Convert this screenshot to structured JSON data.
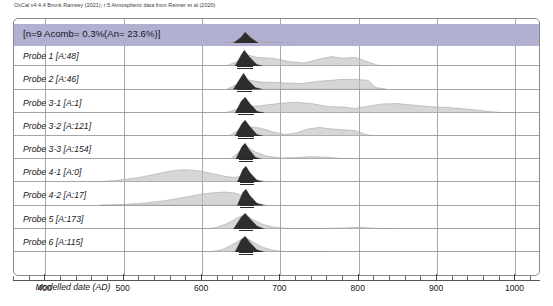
{
  "credit": "OxCal v4.4.4 Bronk Ramsey (2021); r:5 Atmospheric data from Reimer et al (2020)",
  "combined": {
    "label": "[n=9 Acomb= 0.3%(An= 23.6%)]",
    "color": "#b2b0d0"
  },
  "axis": {
    "title": "Modelled date (AD)",
    "ticks": [
      400,
      500,
      600,
      700,
      800,
      900,
      1000
    ],
    "minor_step": 20,
    "range": [
      360,
      1030
    ]
  },
  "chart_data": {
    "type": "area",
    "xlabel": "Modelled date (AD)",
    "ylabel": "",
    "xlim": [
      360,
      1030
    ],
    "grid": true,
    "legend": "none",
    "prior_color": "#bdbdbd",
    "posterior_color": "#2e2e2e",
    "series": [
      {
        "name": "[n=9 Acomb= 0.3%(An= 23.6%)]",
        "agreement": null,
        "posterior_peak": 655,
        "posterior_range": [
          645,
          668
        ],
        "prior": [
          [
            630,
            0
          ],
          [
            645,
            0.18
          ],
          [
            655,
            1.0
          ],
          [
            668,
            0.22
          ],
          [
            690,
            0.05
          ],
          [
            710,
            0
          ]
        ],
        "posterior": [
          [
            640,
            0
          ],
          [
            650,
            0.55
          ],
          [
            655,
            1.0
          ],
          [
            662,
            0.5
          ],
          [
            672,
            0
          ]
        ]
      },
      {
        "name": "Probe 1 [A:48]",
        "agreement": 48,
        "posterior_peak": 653,
        "posterior_range": [
          645,
          665
        ],
        "prior": [
          [
            630,
            0
          ],
          [
            645,
            0.3
          ],
          [
            655,
            0.75
          ],
          [
            670,
            0.55
          ],
          [
            690,
            0.5
          ],
          [
            710,
            0.3
          ],
          [
            730,
            0.2
          ],
          [
            750,
            0.45
          ],
          [
            765,
            0.6
          ],
          [
            780,
            0.5
          ],
          [
            795,
            0.55
          ],
          [
            810,
            0.3
          ],
          [
            825,
            0.05
          ],
          [
            840,
            0
          ]
        ],
        "posterior": [
          [
            642,
            0
          ],
          [
            650,
            0.7
          ],
          [
            654,
            1.0
          ],
          [
            660,
            0.6
          ],
          [
            670,
            0.1
          ],
          [
            678,
            0
          ]
        ]
      },
      {
        "name": "Probe 2 [A:46]",
        "agreement": 46,
        "posterior_peak": 653,
        "posterior_range": [
          644,
          664
        ],
        "prior": [
          [
            632,
            0
          ],
          [
            646,
            0.35
          ],
          [
            656,
            0.6
          ],
          [
            675,
            0.45
          ],
          [
            700,
            0.4
          ],
          [
            725,
            0.35
          ],
          [
            750,
            0.5
          ],
          [
            775,
            0.6
          ],
          [
            795,
            0.62
          ],
          [
            812,
            0.55
          ],
          [
            822,
            0.1
          ],
          [
            835,
            0
          ]
        ],
        "posterior": [
          [
            640,
            0
          ],
          [
            649,
            0.7
          ],
          [
            653,
            1.0
          ],
          [
            659,
            0.55
          ],
          [
            668,
            0.1
          ],
          [
            676,
            0
          ]
        ]
      },
      {
        "name": "Probe 3-1 [A:1]",
        "agreement": 1,
        "posterior_peak": 655,
        "posterior_range": [
          646,
          666
        ],
        "prior": [
          [
            628,
            0
          ],
          [
            645,
            0.25
          ],
          [
            660,
            0.4
          ],
          [
            680,
            0.5
          ],
          [
            700,
            0.62
          ],
          [
            720,
            0.68
          ],
          [
            740,
            0.6
          ],
          [
            760,
            0.42
          ],
          [
            780,
            0.38
          ],
          [
            795,
            0.3
          ],
          [
            810,
            0.42
          ],
          [
            830,
            0.58
          ],
          [
            850,
            0.6
          ],
          [
            870,
            0.5
          ],
          [
            890,
            0.42
          ],
          [
            915,
            0.35
          ],
          [
            940,
            0.25
          ],
          [
            965,
            0.12
          ],
          [
            990,
            0
          ]
        ],
        "posterior": [
          [
            642,
            0
          ],
          [
            650,
            0.75
          ],
          [
            655,
            1.0
          ],
          [
            661,
            0.6
          ],
          [
            670,
            0.12
          ],
          [
            680,
            0
          ]
        ]
      },
      {
        "name": "Probe 3-2 [A:121]",
        "agreement": 121,
        "posterior_peak": 655,
        "posterior_range": [
          646,
          666
        ],
        "prior": [
          [
            634,
            0
          ],
          [
            648,
            0.45
          ],
          [
            658,
            0.62
          ],
          [
            675,
            0.5
          ],
          [
            692,
            0.25
          ],
          [
            706,
            0.1
          ],
          [
            720,
            0.2
          ],
          [
            735,
            0.45
          ],
          [
            750,
            0.55
          ],
          [
            765,
            0.45
          ],
          [
            780,
            0.4
          ],
          [
            795,
            0.35
          ],
          [
            808,
            0.12
          ],
          [
            820,
            0
          ]
        ],
        "posterior": [
          [
            642,
            0
          ],
          [
            651,
            0.8
          ],
          [
            655,
            1.0
          ],
          [
            661,
            0.6
          ],
          [
            670,
            0.1
          ],
          [
            678,
            0
          ]
        ]
      },
      {
        "name": "Probe 3-3 [A:154]",
        "agreement": 154,
        "posterior_peak": 655,
        "posterior_range": [
          647,
          665
        ],
        "prior": [
          [
            636,
            0
          ],
          [
            648,
            0.5
          ],
          [
            657,
            0.8
          ],
          [
            668,
            0.45
          ],
          [
            682,
            0.2
          ],
          [
            700,
            0.08
          ],
          [
            720,
            0.1
          ],
          [
            740,
            0.16
          ],
          [
            760,
            0.12
          ],
          [
            778,
            0.05
          ],
          [
            795,
            0
          ]
        ],
        "posterior": [
          [
            643,
            0
          ],
          [
            651,
            0.8
          ],
          [
            655,
            1.0
          ],
          [
            660,
            0.6
          ],
          [
            668,
            0.12
          ],
          [
            676,
            0
          ]
        ]
      },
      {
        "name": "Probe 4-1 [A:0]",
        "agreement": 0,
        "posterior_peak": 655,
        "posterior_range": [
          648,
          666
        ],
        "prior": [
          [
            460,
            0
          ],
          [
            490,
            0.1
          ],
          [
            520,
            0.3
          ],
          [
            545,
            0.55
          ],
          [
            562,
            0.72
          ],
          [
            578,
            0.78
          ],
          [
            595,
            0.72
          ],
          [
            612,
            0.55
          ],
          [
            628,
            0.38
          ],
          [
            640,
            0.3
          ],
          [
            650,
            0.35
          ],
          [
            660,
            0.3
          ],
          [
            672,
            0.12
          ],
          [
            685,
            0
          ]
        ],
        "posterior": [
          [
            645,
            0
          ],
          [
            652,
            0.8
          ],
          [
            656,
            1.0
          ],
          [
            661,
            0.6
          ],
          [
            670,
            0.12
          ],
          [
            678,
            0
          ]
        ]
      },
      {
        "name": "Probe 4-2 [A:17]",
        "agreement": 17,
        "posterior_peak": 655,
        "posterior_range": [
          648,
          666
        ],
        "prior": [
          [
            470,
            0
          ],
          [
            500,
            0.05
          ],
          [
            530,
            0.15
          ],
          [
            555,
            0.3
          ],
          [
            578,
            0.5
          ],
          [
            598,
            0.68
          ],
          [
            615,
            0.78
          ],
          [
            630,
            0.82
          ],
          [
            642,
            0.76
          ],
          [
            652,
            0.6
          ],
          [
            660,
            0.3
          ],
          [
            670,
            0.1
          ],
          [
            682,
            0
          ]
        ],
        "posterior": [
          [
            645,
            0
          ],
          [
            652,
            0.8
          ],
          [
            656,
            1.0
          ],
          [
            661,
            0.6
          ],
          [
            670,
            0.12
          ],
          [
            678,
            0
          ]
        ]
      },
      {
        "name": "Probe 5 [A:173]",
        "agreement": 173,
        "posterior_peak": 655,
        "posterior_range": [
          647,
          665
        ],
        "prior": [
          [
            600,
            0
          ],
          [
            618,
            0.1
          ],
          [
            632,
            0.35
          ],
          [
            645,
            0.7
          ],
          [
            655,
            0.9
          ],
          [
            665,
            0.6
          ],
          [
            678,
            0.3
          ],
          [
            692,
            0.12
          ],
          [
            710,
            0.05
          ],
          [
            740,
            0.03
          ],
          [
            780,
            0.08
          ],
          [
            800,
            0.12
          ],
          [
            820,
            0.06
          ],
          [
            845,
            0
          ]
        ],
        "posterior": [
          [
            640,
            0
          ],
          [
            650,
            0.75
          ],
          [
            655,
            1.0
          ],
          [
            661,
            0.65
          ],
          [
            670,
            0.2
          ],
          [
            680,
            0
          ]
        ]
      },
      {
        "name": "Probe 6 [A:115]",
        "agreement": 115,
        "posterior_peak": 655,
        "posterior_range": [
          647,
          665
        ],
        "prior": [
          [
            608,
            0
          ],
          [
            625,
            0.15
          ],
          [
            638,
            0.45
          ],
          [
            650,
            0.8
          ],
          [
            657,
            0.88
          ],
          [
            666,
            0.6
          ],
          [
            678,
            0.3
          ],
          [
            690,
            0.12
          ],
          [
            705,
            0.05
          ],
          [
            725,
            0.02
          ],
          [
            760,
            0
          ]
        ],
        "posterior": [
          [
            642,
            0
          ],
          [
            650,
            0.78
          ],
          [
            655,
            1.0
          ],
          [
            661,
            0.6
          ],
          [
            670,
            0.15
          ],
          [
            680,
            0
          ]
        ]
      }
    ]
  }
}
